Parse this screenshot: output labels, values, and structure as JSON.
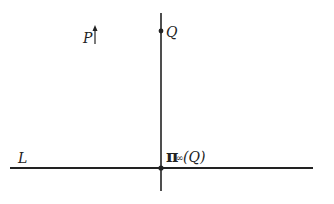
{
  "diagram": {
    "labels": {
      "line_L": "L",
      "point_P": "P",
      "point_Q": "Q",
      "projection_symbol": "π",
      "projection_subscript": "∞",
      "projection_arg": "(Q)"
    },
    "elements": {
      "horizontal_line": {
        "name": "L",
        "x1": 10,
        "x2": 313,
        "y": 168
      },
      "vertical_line": {
        "x": 161,
        "y1": 13,
        "y2": 191
      },
      "point_Q": {
        "x": 161,
        "y": 31
      },
      "intersection_point": {
        "x": 161,
        "y": 168,
        "label": "π∞(Q)"
      },
      "direction_arrow_P": {
        "x": 95,
        "y1": 44,
        "y2": 28
      }
    },
    "colors": {
      "stroke": "#222222",
      "background": "#ffffff"
    }
  }
}
